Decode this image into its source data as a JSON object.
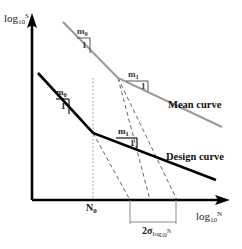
{
  "figure": {
    "type": "diagram",
    "background_color": "#ffffff"
  },
  "axes": {
    "y": {
      "label_base": "log",
      "label_sub": "10",
      "label_sup": "S",
      "color": "#000000",
      "arrow": true
    },
    "x": {
      "label_base": "log",
      "label_sub": "10",
      "label_sup": "N",
      "color": "#000000",
      "arrow": true
    },
    "origin_px": [
      32,
      200
    ],
    "x_end_px": [
      228,
      200
    ],
    "y_end_px": [
      32,
      18
    ]
  },
  "curves": [
    {
      "name": "mean-curve",
      "label": "Mean curve",
      "color": "#9a9a9a",
      "stroke_width": 2.1,
      "points_px": [
        [
          63,
          22
        ],
        [
          118,
          78
        ],
        [
          222,
          127
        ]
      ],
      "knee_px": [
        118,
        78
      ],
      "segments": [
        {
          "slope_name": "m0",
          "from_px": [
            63,
            22
          ],
          "to_px": [
            118,
            78
          ]
        },
        {
          "slope_name": "m1",
          "from_px": [
            118,
            78
          ],
          "to_px": [
            222,
            127
          ]
        }
      ]
    },
    {
      "name": "design-curve",
      "label": "Design curve",
      "color": "#000000",
      "stroke_width": 2.6,
      "points_px": [
        [
          38,
          73
        ],
        [
          93,
          133
        ],
        [
          216,
          180
        ]
      ],
      "knee_px": [
        93,
        133
      ],
      "segments": [
        {
          "slope_name": "m0",
          "from_px": [
            38,
            73
          ],
          "to_px": [
            93,
            133
          ]
        },
        {
          "slope_name": "m1",
          "from_px": [
            93,
            133
          ],
          "to_px": [
            216,
            180
          ]
        }
      ]
    }
  ],
  "slope_markers": [
    {
      "id": "mean-slope-m0",
      "numerator": "m",
      "numerator_sub": "0",
      "denominator": "1",
      "color": "#555555",
      "tri_px": {
        "x": 74,
        "y": 36,
        "w": 14,
        "h": 16
      }
    },
    {
      "id": "mean-slope-m1",
      "numerator": "m",
      "numerator_sub": "1",
      "denominator": "1",
      "color": "#555555",
      "tri_px": {
        "x": 120,
        "y": 80,
        "w": 22,
        "h": 10
      }
    },
    {
      "id": "design-slope-m0",
      "numerator": "m",
      "numerator_sub": "0",
      "denominator": "1",
      "color": "#000000",
      "tri_px": {
        "x": 53,
        "y": 97,
        "w": 14,
        "h": 16
      }
    },
    {
      "id": "design-slope-m1",
      "numerator": "m",
      "numerator_sub": "1",
      "denominator": "1",
      "color": "#000000",
      "tri_px": {
        "x": 113,
        "y": 137,
        "w": 21,
        "h": 10
      }
    }
  ],
  "slope_label_text": {
    "mean_m0": "m",
    "mean_m0_sub": "0",
    "mean_m1": "m",
    "mean_m1_sub": "1",
    "design_m0": "m",
    "design_m0_sub": "0",
    "design_m1": "m",
    "design_m1_sub": "1",
    "one": "1"
  },
  "ticks": {
    "n0": {
      "label_base": "N",
      "label_sub": "0",
      "x_px": 93,
      "guide_from_px": [
        93,
        133
      ],
      "guide_to_px": [
        93,
        200
      ],
      "color": "#777777"
    }
  },
  "scatter_band": {
    "label_base": "2σ",
    "label_sub_base": "log",
    "label_sub_sub": "10",
    "label_sub_sup": "N",
    "left_px": 130,
    "right_px": 176,
    "bar_y_px": 221,
    "top_y_px": 200,
    "color": "#8d8d8d"
  },
  "dashed_lines": [
    {
      "id": "dashed-mean-extension",
      "from_px": [
        118,
        78
      ],
      "to_px": [
        176,
        200
      ],
      "color": "#666666"
    },
    {
      "id": "dashed-design-extension",
      "from_px": [
        93,
        133
      ],
      "to_px": [
        130,
        200
      ],
      "color": "#666666"
    },
    {
      "id": "dashed-mean-lower",
      "from_px": [
        118,
        78
      ],
      "to_px": [
        150,
        200
      ],
      "color": "#666666"
    }
  ],
  "labels": {
    "mean_curve": "Mean curve",
    "design_curve": "Design curve",
    "n0": "N",
    "n0_sub": "0",
    "sigma": "2σ",
    "y_axis": "log",
    "y_axis_sub": "10",
    "y_axis_sup": "S",
    "x_axis": "log",
    "x_axis_sub": "10",
    "x_axis_sup": "N"
  },
  "colors": {
    "mean_curve": "#9a9a9a",
    "design_curve": "#000000",
    "axis": "#000000",
    "dashed": "#666666",
    "guide": "#777777",
    "band": "#8d8d8d",
    "text": "#111111"
  }
}
